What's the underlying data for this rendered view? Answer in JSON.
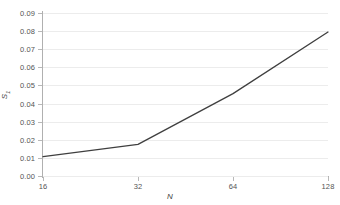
{
  "chart_data": {
    "type": "line",
    "title": "",
    "subtitle": "",
    "xlabel": "N",
    "ylabel": "S1",
    "ylabel_base": "S",
    "ylabel_sub": "1",
    "x": [
      16,
      32,
      64,
      128
    ],
    "x_tick_labels": [
      "16",
      "32",
      "64",
      "128"
    ],
    "x_scale": "log2",
    "xlim": [
      16,
      128
    ],
    "values": [
      0.0107,
      0.0175,
      0.0455,
      0.0795
    ],
    "series": [
      {
        "name": "S1",
        "values": [
          0.0107,
          0.0175,
          0.0455,
          0.0795
        ]
      }
    ],
    "ylim": [
      0.0,
      0.09
    ],
    "y_ticks": [
      0.0,
      0.01,
      0.02,
      0.03,
      0.04,
      0.05,
      0.06,
      0.07,
      0.08,
      0.09
    ],
    "y_tick_labels": [
      "0.00",
      "0.01",
      "0.02",
      "0.03",
      "0.04",
      "0.05",
      "0.06",
      "0.07",
      "0.08",
      "0.09"
    ],
    "grid": true,
    "grid_axis": "y",
    "legend": false,
    "legend_position": "none",
    "markers": false,
    "line_color": "#3f3f3f",
    "grid_color": "#ececec",
    "axis_color": "#b0b0b0",
    "text_color": "#545454",
    "background_color": "#ffffff",
    "annotations": []
  }
}
